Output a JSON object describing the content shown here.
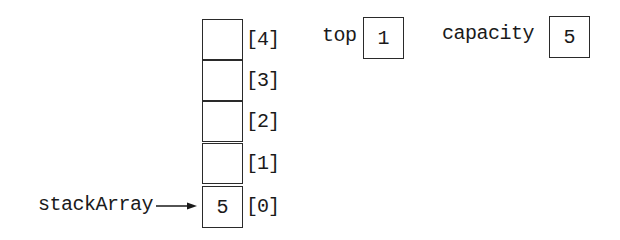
{
  "diagram": {
    "array_label": "stackArray",
    "cells": [
      {
        "index_label": "[4]",
        "value": ""
      },
      {
        "index_label": "[3]",
        "value": ""
      },
      {
        "index_label": "[2]",
        "value": ""
      },
      {
        "index_label": "[1]",
        "value": ""
      },
      {
        "index_label": "[0]",
        "value": "5"
      }
    ],
    "top": {
      "label": "top",
      "value": "1"
    },
    "capacity": {
      "label": "capacity",
      "value": "5"
    }
  }
}
